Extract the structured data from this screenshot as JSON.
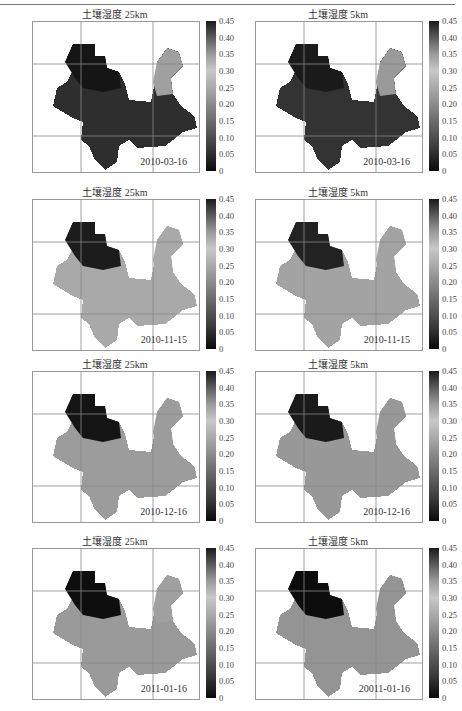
{
  "chart_data": [
    {
      "type": "heatmap",
      "title": "土壤湿度 25km",
      "annotation": "2010-03-16",
      "colorbar": {
        "min": 0,
        "max": 0.45,
        "ticks": [
          "0.45",
          "0.40",
          "0.35",
          "0.30",
          "0.25",
          "0.20",
          "0.15",
          "0.10",
          "0.05",
          "0"
        ]
      },
      "dominant_value": "~0.05 (dark, dry) with lighter NE region ~0.25-0.30"
    },
    {
      "type": "heatmap",
      "title": "土壤湿度 5km",
      "annotation": "2010-03-16",
      "colorbar": {
        "min": 0,
        "max": 0.45,
        "ticks": [
          "0.45",
          "0.40",
          "0.35",
          "0.30",
          "0.25",
          "0.20",
          "0.15",
          "0.10",
          "0.05",
          "0"
        ]
      },
      "dominant_value": "~0.05-0.10 (dark) with lighter NE region"
    },
    {
      "type": "heatmap",
      "title": "土壤湿度 25km",
      "annotation": "2010-11-15",
      "colorbar": {
        "min": 0,
        "max": 0.45,
        "ticks": [
          "0.45",
          "0.40",
          "0.35",
          "0.30",
          "0.25",
          "0.20",
          "0.15",
          "0.10",
          "0.05",
          "0"
        ]
      },
      "dominant_value": "~0.20-0.25 (medium gray)"
    },
    {
      "type": "heatmap",
      "title": "土壤湿度 5km",
      "annotation": "2010-11-15",
      "colorbar": {
        "min": 0,
        "max": 0.45,
        "ticks": [
          "0.45",
          "0.40",
          "0.35",
          "0.30",
          "0.25",
          "0.20",
          "0.15",
          "0.10",
          "0.05",
          "0"
        ]
      },
      "dominant_value": "~0.20-0.25 (medium gray)"
    },
    {
      "type": "heatmap",
      "title": "土壤湿度 25km",
      "annotation": "2010-12-16",
      "colorbar": {
        "min": 0,
        "max": 0.45,
        "ticks": [
          "0.45",
          "0.40",
          "0.35",
          "0.30",
          "0.25",
          "0.20",
          "0.15",
          "0.10",
          "0.05",
          "0"
        ]
      },
      "dominant_value": "~0.20 with dark NW ~0.40+"
    },
    {
      "type": "heatmap",
      "title": "土壤湿度 5km",
      "annotation": "2010-12-16",
      "colorbar": {
        "min": 0,
        "max": 0.45,
        "ticks": [
          "0.45",
          "0.40",
          "0.35",
          "0.30",
          "0.25",
          "0.20",
          "0.15",
          "0.10",
          "0.05",
          "0"
        ]
      },
      "dominant_value": "~0.20 with dark NW ~0.40+"
    },
    {
      "type": "heatmap",
      "title": "土壤湿度 25km",
      "annotation": "2011-01-16",
      "colorbar": {
        "min": 0,
        "max": 0.45,
        "ticks": [
          "0.45",
          "0.40",
          "0.35",
          "0.30",
          "0.25",
          "0.20",
          "0.15",
          "0.10",
          "0.05",
          "0"
        ]
      },
      "dominant_value": "~0.20 with very dark NW ~0.45"
    },
    {
      "type": "heatmap",
      "title": "土壤湿度 5km",
      "annotation": "20011-01-16",
      "colorbar": {
        "min": 0,
        "max": 0.45,
        "ticks": [
          "0.45",
          "0.40",
          "0.35",
          "0.30",
          "0.25",
          "0.20",
          "0.15",
          "0.10",
          "0.05",
          "0"
        ]
      },
      "dominant_value": "~0.20 with very dark NW ~0.45"
    }
  ],
  "panels": [
    {
      "title": "土壤湿度 25km",
      "date": "2010-03-16"
    },
    {
      "title": "土壤湿度 5km",
      "date": "2010-03-16"
    },
    {
      "title": "土壤湿度 25km",
      "date": "2010-11-15"
    },
    {
      "title": "土壤湿度 5km",
      "date": "2010-11-15"
    },
    {
      "title": "土壤湿度 25km",
      "date": "2010-12-16"
    },
    {
      "title": "土壤湿度 5km",
      "date": "2010-12-16"
    },
    {
      "title": "土壤湿度 25km",
      "date": "2011-01-16"
    },
    {
      "title": "土壤湿度 5km",
      "date": "20011-01-16"
    }
  ],
  "colorbar_ticks": [
    "0.45",
    "0.40",
    "0.35",
    "0.30",
    "0.25",
    "0.20",
    "0.15",
    "0.10",
    "0.05",
    "0"
  ]
}
